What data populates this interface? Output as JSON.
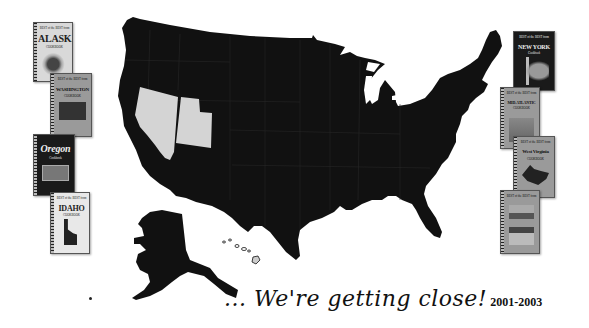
{
  "tagline": {
    "text": "... We're getting close!",
    "years": "2001-2003"
  },
  "map": {
    "highlighted_states": [
      "Nevada",
      "Utah"
    ],
    "fill_color": "#111111",
    "highlight_color": "#d4d4d4",
    "background": "#ffffff"
  },
  "books_left": [
    {
      "header": "BEST of the BEST from",
      "title": "ALASKA",
      "subtitle": "COOKBOOK"
    },
    {
      "header": "BEST of the BEST from",
      "title": "WASHINGTON",
      "subtitle": "COOKBOOK"
    },
    {
      "header": "",
      "title": "Oregon",
      "subtitle": "Cookbook"
    },
    {
      "header": "BEST of the BEST from",
      "title": "IDAHO",
      "subtitle": "COOKBOOK"
    }
  ],
  "books_right": [
    {
      "header": "BEST of the BEST from",
      "title": "NEW YORK",
      "subtitle": "Cookbook"
    },
    {
      "header": "BEST of the BEST from",
      "title": "MID-ATLANTIC",
      "subtitle": "COOKBOOK"
    },
    {
      "header": "BEST of the BEST from",
      "title": "West Virginia",
      "subtitle": "COOKBOOK"
    },
    {
      "header": "BEST of the BEST from",
      "title": "",
      "subtitle": ""
    }
  ]
}
